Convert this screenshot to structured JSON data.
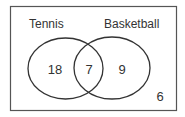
{
  "diagram": {
    "type": "venn",
    "universe": {
      "outside_value": "6"
    },
    "sets": [
      {
        "label": "Tennis",
        "only_value": "18"
      },
      {
        "label": "Basketball",
        "only_value": "9"
      }
    ],
    "intersection_value": "7",
    "colors": {
      "stroke": "#333333",
      "background": "#ffffff"
    }
  }
}
